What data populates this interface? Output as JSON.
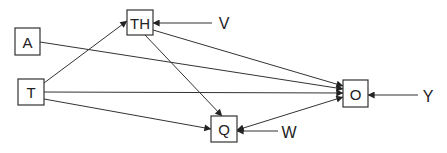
{
  "diagram": {
    "type": "path-diagram",
    "nodes": [
      {
        "id": "A",
        "label": "A",
        "x": 15,
        "y": 28,
        "w": 25,
        "h": 27
      },
      {
        "id": "T",
        "label": "T",
        "x": 18,
        "y": 79,
        "w": 26,
        "h": 26
      },
      {
        "id": "TH",
        "label": "TH",
        "x": 127,
        "y": 10,
        "w": 26,
        "h": 25
      },
      {
        "id": "Q",
        "label": "Q",
        "x": 211,
        "y": 116,
        "w": 26,
        "h": 26
      },
      {
        "id": "O",
        "label": "O",
        "x": 343,
        "y": 80,
        "w": 25,
        "h": 27
      }
    ],
    "external": [
      {
        "id": "V",
        "label": "V",
        "x": 224,
        "y": 23,
        "target": "TH"
      },
      {
        "id": "W",
        "label": "W",
        "x": 289,
        "y": 132,
        "target": "Q"
      },
      {
        "id": "Y",
        "label": "Y",
        "x": 428,
        "y": 95,
        "target": "O"
      }
    ],
    "edges": [
      {
        "from": "T",
        "to": "TH",
        "directed": true
      },
      {
        "from": "A",
        "to": "O",
        "directed": true
      },
      {
        "from": "TH",
        "to": "O",
        "directed": true
      },
      {
        "from": "TH",
        "to": "Q",
        "directed": true
      },
      {
        "from": "T",
        "to": "O",
        "directed": true
      },
      {
        "from": "T",
        "to": "Q",
        "directed": true
      },
      {
        "from": "Q",
        "to": "O",
        "directed": true,
        "bidirectional": true
      },
      {
        "from": "V",
        "to": "TH",
        "directed": true
      },
      {
        "from": "W",
        "to": "Q",
        "directed": true
      },
      {
        "from": "Y",
        "to": "O",
        "directed": true
      }
    ]
  }
}
